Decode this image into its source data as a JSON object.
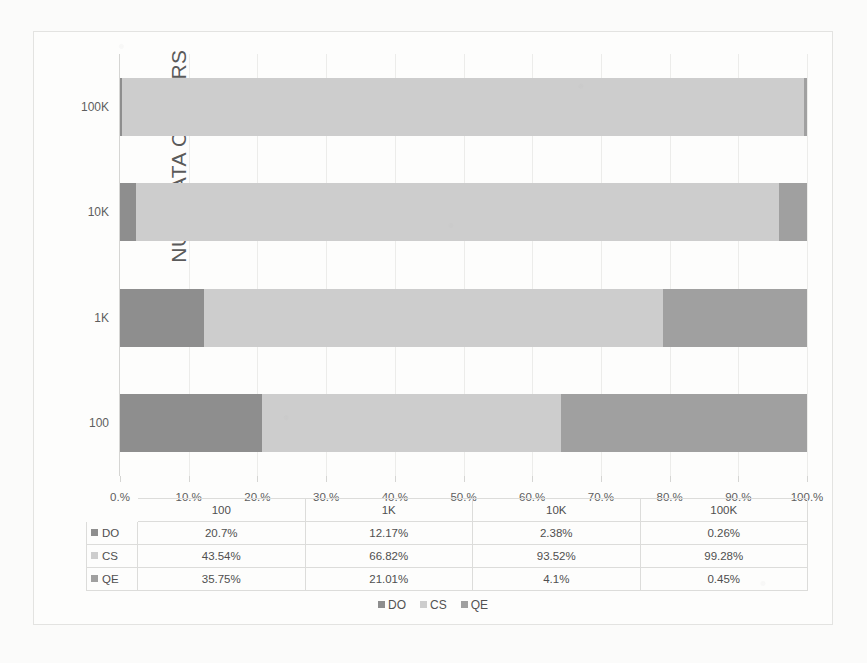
{
  "chart_data": {
    "type": "bar",
    "orientation": "horizontal",
    "stacked": true,
    "normalized_percent": true,
    "title": "",
    "xlabel": "",
    "ylabel": "NUM DATA OWNERS",
    "categories": [
      "100",
      "1K",
      "10K",
      "100K"
    ],
    "category_order_top_to_bottom": [
      "100K",
      "10K",
      "1K",
      "100"
    ],
    "series": [
      {
        "name": "DO",
        "color": "#8e8e8e",
        "values": [
          20.7,
          12.17,
          2.38,
          0.26
        ],
        "labels": [
          "20.7%",
          "12.17%",
          "2.38%",
          "0.26%"
        ]
      },
      {
        "name": "CS",
        "color": "#cdcdcd",
        "values": [
          43.54,
          66.82,
          93.52,
          99.28
        ],
        "labels": [
          "43.54%",
          "66.82%",
          "93.52%",
          "99.28%"
        ]
      },
      {
        "name": "QE",
        "color": "#a0a0a0",
        "values": [
          35.75,
          21.01,
          4.1,
          0.45
        ],
        "labels": [
          "35.75%",
          "21.01%",
          "4.1%",
          "0.45%"
        ]
      }
    ],
    "xlim": [
      0,
      100
    ],
    "xticks": [
      0,
      10,
      20,
      30,
      40,
      50,
      60,
      70,
      80,
      90,
      100
    ],
    "xtick_labels": [
      "0.%",
      "10.%",
      "20.%",
      "30.%",
      "40.%",
      "50.%",
      "60.%",
      "70.%",
      "80.%",
      "90.%",
      "100.%"
    ],
    "grid": true,
    "legend_position": "bottom",
    "legend_entries": [
      "DO",
      "CS",
      "QE"
    ],
    "data_table_visible": true
  },
  "table": {
    "column_headers": [
      "",
      "100",
      "1K",
      "10K",
      "100K"
    ],
    "rows": [
      {
        "label": "DO",
        "color": "#8e8e8e",
        "cells": [
          "20.7%",
          "12.17%",
          "2.38%",
          "0.26%"
        ]
      },
      {
        "label": "CS",
        "color": "#cdcdcd",
        "cells": [
          "43.54%",
          "66.82%",
          "93.52%",
          "99.28%"
        ]
      },
      {
        "label": "QE",
        "color": "#a0a0a0",
        "cells": [
          "35.75%",
          "21.01%",
          "4.1%",
          "0.45%"
        ]
      }
    ]
  },
  "colors": {
    "do": "#8e8e8e",
    "cs": "#cdcdcd",
    "qe": "#a0a0a0",
    "grid": "#ececea",
    "axis": "#d5d5d3",
    "text": "#5a5a5a",
    "background": "#fdfdfc",
    "page_background": "#fbfbfa"
  }
}
